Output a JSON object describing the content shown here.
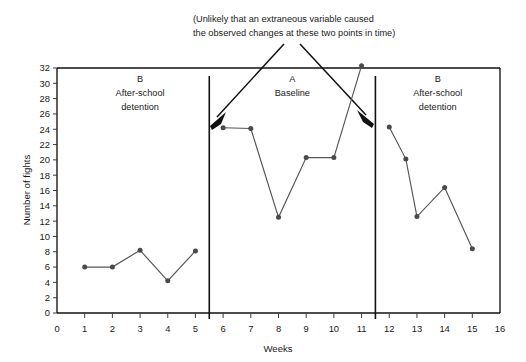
{
  "annotation": {
    "line1": "(Unlikely that an extraneous variable caused",
    "line2": "the observed changes at these two points in time)"
  },
  "phases": [
    {
      "letter": "B",
      "name_line1": "After-school",
      "name_line2": "detention",
      "center_week": 3
    },
    {
      "letter": "A",
      "name_line1": "Baseline",
      "name_line2": "",
      "center_week": 8.5
    },
    {
      "letter": "B",
      "name_line1": "After-school",
      "name_line2": "detention",
      "center_week": 13.75
    }
  ],
  "dividers": [
    5.5,
    11.5
  ],
  "colors": {
    "line": "#555555",
    "marker": "#4a4a4a",
    "frame": "#111111",
    "arrow": "#111111",
    "text": "#1a1a1a"
  },
  "chart_data": {
    "type": "line",
    "title": "",
    "xlabel": "Weeks",
    "ylabel": "Number of fights",
    "xlim": [
      0,
      16
    ],
    "ylim": [
      0,
      32
    ],
    "xticks": [
      0,
      1,
      2,
      3,
      4,
      5,
      6,
      7,
      8,
      9,
      10,
      11,
      12,
      13,
      14,
      15,
      16
    ],
    "yticks": [
      0,
      2,
      4,
      6,
      8,
      10,
      12,
      14,
      16,
      18,
      20,
      22,
      24,
      26,
      28,
      30,
      32
    ],
    "grid": false,
    "legend": "none",
    "annotations": [
      "(Unlikely that an extraneous variable caused the observed changes at these two points in time)",
      "B After-school detention",
      "A Baseline",
      "B After-school detention"
    ],
    "phase_dividers": [
      5.5,
      11.5
    ],
    "series": [
      {
        "name": "B After-school detention (phase 1)",
        "x": [
          1,
          2,
          3,
          4,
          5
        ],
        "values": [
          6,
          6,
          8.2,
          4.2,
          8.1
        ]
      },
      {
        "name": "A Baseline (phase 2)",
        "x": [
          6,
          7,
          8,
          9,
          10,
          11
        ],
        "values": [
          24.2,
          24.1,
          12.5,
          20.3,
          20.3,
          32.3
        ]
      },
      {
        "name": "B After-school detention (phase 3)",
        "x": [
          12,
          12.6,
          13,
          14,
          15
        ],
        "values": [
          24.3,
          20.1,
          12.6,
          16.4,
          8.4
        ]
      }
    ]
  }
}
